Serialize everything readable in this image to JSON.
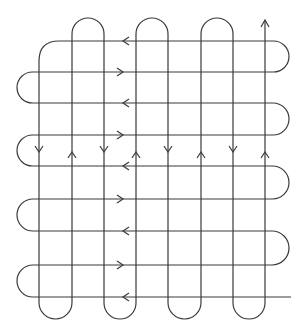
{
  "diagram": {
    "type": "serpentine-weave",
    "stroke_color": "#3a3a3a",
    "background": "#ffffff",
    "vertical_lines_x": [
      39,
      72,
      104,
      136,
      168,
      201,
      233,
      265
    ],
    "horizontal_lines_y": [
      41,
      72,
      103,
      135,
      166,
      199,
      231,
      265,
      297
    ],
    "vertical_arrow_y": 152,
    "vertical_arrow_directions": [
      "down",
      "up",
      "down",
      "up",
      "down",
      "up",
      "down",
      "up"
    ],
    "horizontal_arrow_x": 123,
    "horizontal_arrow_directions": [
      "left",
      "right",
      "left",
      "right",
      "left",
      "right",
      "left",
      "right",
      "left"
    ],
    "top_arch_y": 18,
    "bottom_arch_y": 319,
    "left_loop_x": 17,
    "right_loop_x": 289,
    "end_arrow": {
      "x": 265,
      "y": 20,
      "direction": "up"
    },
    "bottom_line_end_x": 291
  }
}
